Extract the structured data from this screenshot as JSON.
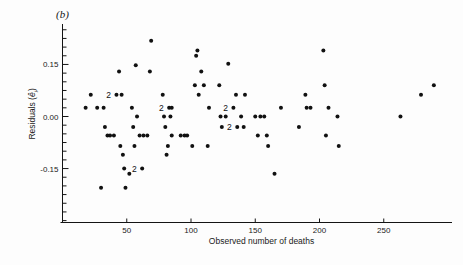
{
  "figure": {
    "panel_label": "(b)",
    "background": "#fdfdfd",
    "marker_color": "#111111"
  },
  "axes": {
    "x_label": "Observed number of deaths",
    "y_label_prefix": "Residuals (",
    "y_label_hat": "e",
    "y_label_sub": "i",
    "y_label_suffix": ")",
    "x_ticks": [
      50,
      100,
      150,
      200,
      250
    ],
    "x_tick_labels": [
      "50",
      "100",
      "150",
      "200",
      "250"
    ],
    "y_ticks": [
      0.15,
      0.0,
      -0.15
    ],
    "y_tick_labels": [
      "0.15",
      "0.00",
      "-0.15"
    ],
    "x_minor_step": 0,
    "y_minor_step": 0.025
  },
  "chart_data": {
    "type": "scatter",
    "title": "(b)",
    "xlabel": "Observed number of deaths",
    "ylabel": "Residuals (e-hat_i)",
    "xlim": [
      0,
      300
    ],
    "ylim": [
      -0.26,
      0.27
    ],
    "grid": false,
    "legend": "none",
    "marker": "filled-circle",
    "x_ticks": [
      50,
      100,
      150,
      200,
      250
    ],
    "y_ticks": [
      -0.15,
      0.0,
      0.15
    ],
    "points": [
      {
        "x": 18,
        "y": 0.025
      },
      {
        "x": 22,
        "y": 0.063
      },
      {
        "x": 27,
        "y": 0.025
      },
      {
        "x": 30,
        "y": -0.205
      },
      {
        "x": 32,
        "y": 0.025
      },
      {
        "x": 33,
        "y": -0.03
      },
      {
        "x": 35,
        "y": -0.055
      },
      {
        "x": 37,
        "y": -0.055
      },
      {
        "x": 40,
        "y": -0.055
      },
      {
        "x": 42,
        "y": 0.063,
        "count": 2,
        "label": "2"
      },
      {
        "x": 44,
        "y": 0.13
      },
      {
        "x": 45,
        "y": -0.085
      },
      {
        "x": 46,
        "y": 0.063
      },
      {
        "x": 47,
        "y": -0.11
      },
      {
        "x": 48,
        "y": -0.15
      },
      {
        "x": 49,
        "y": -0.205
      },
      {
        "x": 52,
        "y": -0.165
      },
      {
        "x": 54,
        "y": 0.025
      },
      {
        "x": 55,
        "y": -0.03
      },
      {
        "x": 56,
        "y": -0.085
      },
      {
        "x": 57,
        "y": 0.148
      },
      {
        "x": 58,
        "y": 0.0
      },
      {
        "x": 60,
        "y": -0.055
      },
      {
        "x": 62,
        "y": -0.15,
        "count": 2,
        "label": "2"
      },
      {
        "x": 63,
        "y": -0.055
      },
      {
        "x": 66,
        "y": -0.055
      },
      {
        "x": 68,
        "y": 0.13
      },
      {
        "x": 69,
        "y": 0.218
      },
      {
        "x": 78,
        "y": 0.063
      },
      {
        "x": 79,
        "y": 0.0
      },
      {
        "x": 80,
        "y": -0.03
      },
      {
        "x": 81,
        "y": -0.11
      },
      {
        "x": 82,
        "y": -0.085
      },
      {
        "x": 83,
        "y": 0.025,
        "count": 2,
        "label": "2"
      },
      {
        "x": 84,
        "y": 0.0
      },
      {
        "x": 85,
        "y": 0.025
      },
      {
        "x": 85,
        "y": -0.055
      },
      {
        "x": 92,
        "y": -0.055
      },
      {
        "x": 95,
        "y": -0.055
      },
      {
        "x": 97,
        "y": -0.055
      },
      {
        "x": 101,
        "y": -0.085
      },
      {
        "x": 103,
        "y": 0.09
      },
      {
        "x": 104,
        "y": 0.175
      },
      {
        "x": 105,
        "y": 0.19
      },
      {
        "x": 106,
        "y": 0.063
      },
      {
        "x": 108,
        "y": 0.13
      },
      {
        "x": 110,
        "y": 0.09
      },
      {
        "x": 113,
        "y": -0.085
      },
      {
        "x": 114,
        "y": 0.025
      },
      {
        "x": 122,
        "y": 0.09
      },
      {
        "x": 123,
        "y": 0.0
      },
      {
        "x": 124,
        "y": -0.03
      },
      {
        "x": 127,
        "y": 0.0
      },
      {
        "x": 129,
        "y": 0.152
      },
      {
        "x": 133,
        "y": 0.025,
        "count": 2,
        "label": "2"
      },
      {
        "x": 135,
        "y": 0.063
      },
      {
        "x": 136,
        "y": -0.03,
        "count": 2,
        "label": "2"
      },
      {
        "x": 139,
        "y": 0.0
      },
      {
        "x": 141,
        "y": -0.03
      },
      {
        "x": 142,
        "y": 0.063
      },
      {
        "x": 150,
        "y": 0.0
      },
      {
        "x": 152,
        "y": -0.055
      },
      {
        "x": 154,
        "y": 0.0
      },
      {
        "x": 157,
        "y": 0.0
      },
      {
        "x": 159,
        "y": -0.055
      },
      {
        "x": 160,
        "y": -0.085
      },
      {
        "x": 165,
        "y": -0.165
      },
      {
        "x": 170,
        "y": 0.025
      },
      {
        "x": 184,
        "y": -0.03
      },
      {
        "x": 189,
        "y": 0.063
      },
      {
        "x": 190,
        "y": 0.025
      },
      {
        "x": 193,
        "y": 0.025
      },
      {
        "x": 203,
        "y": 0.19
      },
      {
        "x": 204,
        "y": 0.09
      },
      {
        "x": 205,
        "y": -0.055
      },
      {
        "x": 207,
        "y": 0.025
      },
      {
        "x": 214,
        "y": 0.0
      },
      {
        "x": 215,
        "y": -0.085
      },
      {
        "x": 263,
        "y": 0.0
      },
      {
        "x": 279,
        "y": 0.063
      },
      {
        "x": 289,
        "y": 0.09
      }
    ]
  }
}
